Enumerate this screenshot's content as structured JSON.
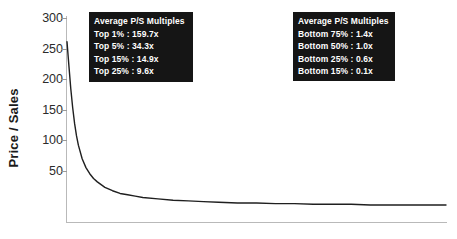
{
  "chart_data": {
    "type": "line",
    "title": "",
    "xlabel": "",
    "ylabel": "Price / Sales",
    "ylim": [
      0,
      300
    ],
    "xlim": [
      0,
      100
    ],
    "grid": false,
    "y_ticks": [
      300,
      250,
      200,
      150,
      100,
      50
    ],
    "x_ticks": [],
    "legend_position": "top-inside",
    "series": [
      {
        "name": "Price / Sales distribution",
        "description": "Companies ranked from highest to lowest price-to-sales multiple",
        "x": [
          0,
          0.5,
          1,
          1.5,
          2,
          2.5,
          3,
          4,
          5,
          6,
          7,
          8,
          9,
          10,
          12,
          14,
          16,
          18,
          20,
          24,
          28,
          32,
          36,
          40,
          45,
          50,
          55,
          60,
          65,
          70,
          75,
          80,
          85,
          90,
          95,
          100
        ],
        "values": [
          265,
          230,
          196,
          168,
          145,
          127,
          113,
          93,
          80,
          71,
          64,
          59,
          55,
          51,
          46,
          42,
          40,
          38,
          36,
          34,
          32,
          31,
          30,
          29,
          28,
          28,
          27,
          27,
          26,
          26,
          26,
          25,
          25,
          25,
          25,
          25
        ]
      }
    ]
  },
  "axis": {
    "y_title": "Price / Sales",
    "y_tick_labels": [
      "300",
      "250",
      "200",
      "150",
      "100",
      "50"
    ]
  },
  "legend_top": {
    "title": "Average P/S Multiples",
    "entries": [
      "Top 1% : 159.7x",
      "Top 5% : 34.3x",
      "Top 15% : 14.9x",
      "Top 25% : 9.6x"
    ]
  },
  "legend_bottom": {
    "title": "Average P/S Multiples",
    "entries": [
      "Bottom 75% : 1.4x",
      "Bottom 50% : 1.0x",
      "Bottom 25% : 0.6x",
      "Bottom 15% : 0.1x"
    ]
  },
  "colors": {
    "curve": "#1f1f1f",
    "axis": "#b9b9b9",
    "legend_background": "#151515",
    "legend_text": "#ffffff",
    "tick_label": "#2b2b2b"
  }
}
